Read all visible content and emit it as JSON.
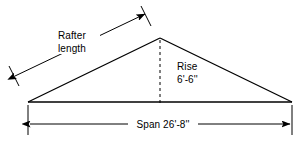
{
  "diagram": {
    "background_color": "#ffffff",
    "line_color": "#000000",
    "labels": {
      "rafter_line1": "Rafter",
      "rafter_line2": "length",
      "rise_line1": "Rise",
      "rise_line2": "6'-6''",
      "span": "Span 26'-8''"
    },
    "measurements": {
      "rise_value": "6'-6''",
      "span_value": "26'-8''",
      "rafter_value": ""
    },
    "geometry": {
      "apex_x": 160,
      "apex_y": 38,
      "left_x": 28,
      "right_x": 292,
      "base_y": 102
    }
  }
}
